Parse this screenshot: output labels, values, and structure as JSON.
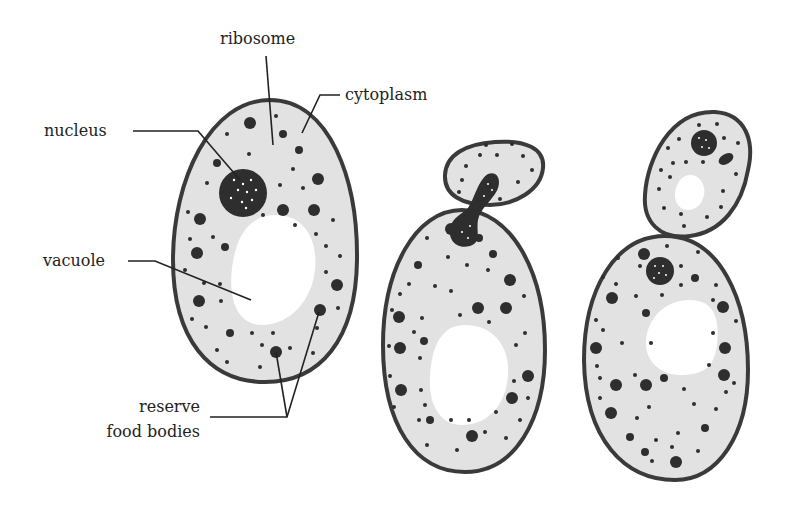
{
  "figure": {
    "labels": {
      "ribosome": "ribosome",
      "cytoplasm": "cytoplasm",
      "nucleus": "nucleus",
      "vacuole": "vacuole",
      "reserve_line1": "reserve",
      "reserve_line2": "food bodies"
    },
    "stages": [
      "mature cell",
      "budding cell",
      "bud separating"
    ],
    "colors": {
      "cytoplasm": "#e2e2e2",
      "cell_wall": "#3a3a3a",
      "granules": "#2e2e2e",
      "vacuole": "#ffffff",
      "text": "#222222"
    }
  }
}
